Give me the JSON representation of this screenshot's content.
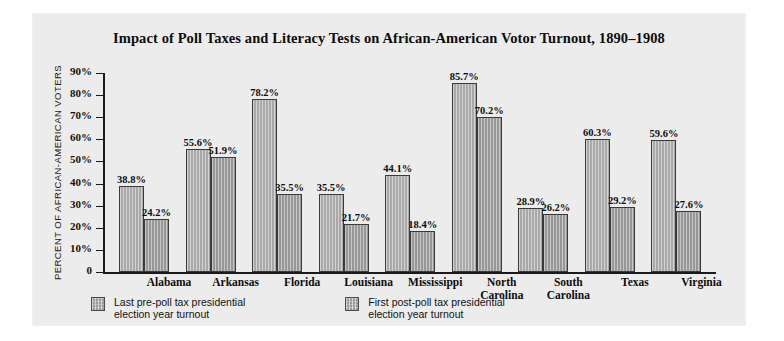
{
  "chart_data": {
    "type": "bar",
    "title": "Impact of Poll Taxes and Literacy Tests on African-American Votor Turnout, 1890–1908",
    "xlabel": "",
    "ylabel": "PERCENT OF AFRICAN-AMERICAN VOTERS",
    "ylim": [
      0,
      90
    ],
    "ytick_labels": [
      "90%",
      "80%",
      "70%",
      "60%",
      "50%",
      "40%",
      "30%",
      "20%",
      "10%",
      "0"
    ],
    "ytick_values": [
      90,
      80,
      70,
      60,
      50,
      40,
      30,
      20,
      10,
      0
    ],
    "grid": false,
    "legend_position": "bottom-left",
    "categories": [
      "Alabama",
      "Arkansas",
      "Florida",
      "Louisiana",
      "Mississippi",
      "North\nCarolina",
      "South\nCarolina",
      "Texas",
      "Virginia"
    ],
    "series": [
      {
        "name": "Last pre-poll tax presidential\nelection year turnout",
        "values": [
          38.8,
          55.6,
          78.2,
          35.5,
          44.1,
          85.7,
          28.9,
          60.3,
          59.6
        ],
        "labels": [
          "38.8%",
          "55.6%",
          "78.2%",
          "35.5%",
          "44.1%",
          "85.7%",
          "28.9%",
          "60.3%",
          "59.6%"
        ],
        "color": "#b3b3b3"
      },
      {
        "name": "First post-poll tax presidential\nelection year turnout",
        "values": [
          24.2,
          51.9,
          35.5,
          21.7,
          18.4,
          70.2,
          26.2,
          29.2,
          27.6
        ],
        "labels": [
          "24.2%",
          "51.9%",
          "35.5%",
          "21.7%",
          "18.4%",
          "70.2%",
          "26.2%",
          "29.2%",
          "27.6%"
        ],
        "color": "#a0a0a0"
      }
    ]
  }
}
